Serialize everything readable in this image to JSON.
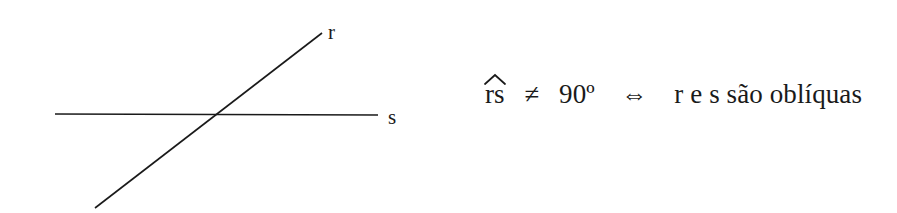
{
  "figure": {
    "background_color": "#ffffff",
    "ink_color": "#1a1a1a",
    "width": 897,
    "height": 213
  },
  "diagram": {
    "caption_r": "r",
    "caption_s": "s",
    "line_r": {
      "name": "r",
      "description": "oblique transversal line rising to the right",
      "x1": 95,
      "y1": 208,
      "x2": 322,
      "y2": 33
    },
    "line_s": {
      "name": "s",
      "description": "horizontal line",
      "x1": 55,
      "y1": 114,
      "x2": 378,
      "y2": 115
    },
    "intersection": {
      "x": 221,
      "y": 115
    },
    "stroke_width": 1.6
  },
  "statement": {
    "angle_letters": "rs",
    "hat_accent": "circumflex-over-rs",
    "not_equal_symbol": "≠",
    "angle_value": "90º",
    "iff_symbol": "⇔",
    "conclusion": "r e s são oblíquas",
    "full_text": "r̂s ≠ 90º ⇔ r e s são oblíquas"
  }
}
